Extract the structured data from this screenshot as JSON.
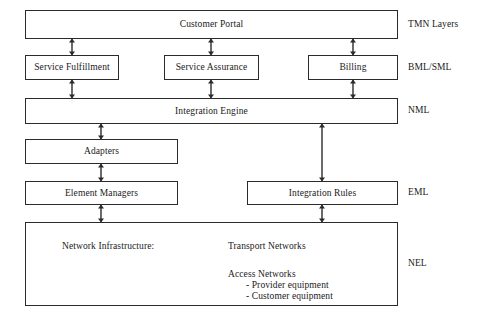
{
  "diagram": {
    "accent_color": "#2b2b2b",
    "background_color": "#ffffff"
  },
  "boxes": {
    "customer_portal": "Customer Portal",
    "service_fulfillment": "Service Fulfillment",
    "service_assurance": "Service Assurance",
    "billing": "Billing",
    "integration_engine": "Integration Engine",
    "adapters": "Adapters",
    "element_managers": "Element Managers",
    "integration_rules": "Integration Rules"
  },
  "network_infrastructure": {
    "title": "Network Infrastructure:",
    "transport_networks": "Transport Networks",
    "access_networks": "Access Networks",
    "provider_equipment": "- Provider equipment",
    "customer_equipment": "- Customer equipment"
  },
  "layer_labels": {
    "tmn": "TMN Layers",
    "bml_sml": "BML/SML",
    "nml": "NML",
    "eml": "EML",
    "nel": "NEL"
  }
}
